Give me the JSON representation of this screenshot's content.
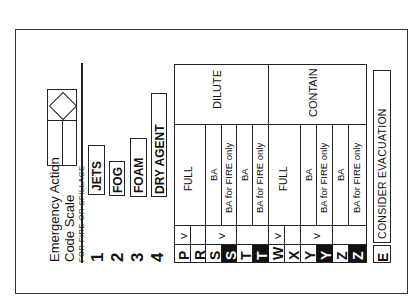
{
  "title": {
    "line1": "Emergency Action",
    "line2": "Code Scale",
    "subtitle": "FOR FIRE OR SPILLAGE"
  },
  "media": [
    {
      "num": "1",
      "label": "JETS"
    },
    {
      "num": "2",
      "label": "FOG"
    },
    {
      "num": "3",
      "label": "FOAM"
    },
    {
      "num": "4",
      "label": "DRY AGENT"
    }
  ],
  "table": {
    "groups": [
      {
        "action": "DILUTE"
      },
      {
        "action": "CONTAIN"
      }
    ],
    "rows": [
      {
        "code": "P",
        "inverted": false,
        "v": "V",
        "protection": "FULL"
      },
      {
        "code": "R",
        "inverted": false,
        "v": "",
        "protection": ""
      },
      {
        "code": "S",
        "inverted": false,
        "v": "V",
        "protection": "BA"
      },
      {
        "code": "S",
        "inverted": true,
        "v": "",
        "protection": "BA for FIRE only"
      },
      {
        "code": "T",
        "inverted": false,
        "v": "",
        "protection": "BA"
      },
      {
        "code": "T",
        "inverted": true,
        "v": "",
        "protection": "BA for FIRE only"
      },
      {
        "code": "W",
        "inverted": false,
        "v": "V",
        "protection": "FULL"
      },
      {
        "code": "X",
        "inverted": false,
        "v": "",
        "protection": ""
      },
      {
        "code": "Y",
        "inverted": false,
        "v": "V",
        "protection": "BA"
      },
      {
        "code": "Y",
        "inverted": true,
        "v": "",
        "protection": "BA for FIRE only"
      },
      {
        "code": "Z",
        "inverted": false,
        "v": "",
        "protection": "BA"
      },
      {
        "code": "Z",
        "inverted": true,
        "v": "",
        "protection": "BA for FIRE only"
      }
    ]
  },
  "evacuation": {
    "code": "E",
    "label": "CONSIDER EVACUATION"
  },
  "colors": {
    "ink": "#111111",
    "paper": "#ffffff"
  }
}
